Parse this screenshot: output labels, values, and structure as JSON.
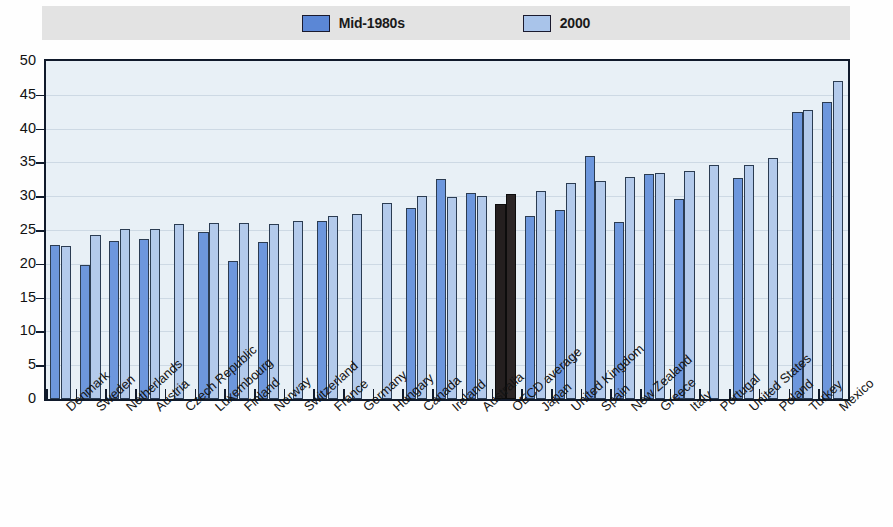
{
  "legend": {
    "items": [
      {
        "label": "Mid-1980s",
        "color": "#6d97dd",
        "key": "mid1980s"
      },
      {
        "label": "2000",
        "color": "#b3caeb",
        "key": "y2000"
      }
    ],
    "background": "#e3e3e3"
  },
  "axis": {
    "y_ticks": [
      "0",
      "5",
      "10",
      "15",
      "20",
      "25",
      "30",
      "35",
      "40",
      "45",
      "50"
    ]
  },
  "colors": {
    "series_mid1980s": "#6d97dd",
    "series_2000": "#b3caeb",
    "highlight_oecd": "#241f1f",
    "plot_background": "#e8f0f6",
    "frame": "#101a2b",
    "gridline": "#cdd9e4",
    "legend_background": "#e3e3e3"
  },
  "chart_data": {
    "type": "bar",
    "title": "",
    "subtitle": "",
    "xlabel": "",
    "ylabel": "",
    "ylim": [
      0,
      50
    ],
    "ytick_step": 5,
    "grid": true,
    "legend_position": "top",
    "highlight_category": "OECD average",
    "categories": [
      "Denmark",
      "Sweden",
      "Netherlands",
      "Austria",
      "Czech Republic",
      "Luxembourg",
      "Finland",
      "Norway",
      "Switzerland",
      "France",
      "Germany",
      "Hungary",
      "Canada",
      "Ireland",
      "Australia",
      "OECD average",
      "Japan",
      "United Kingdom",
      "Spain",
      "New Zealand",
      "Greece",
      "Italy",
      "Portugal",
      "United States",
      "Poland",
      "Turkey",
      "Mexico"
    ],
    "series": [
      {
        "name": "Mid-1980s",
        "color": "#6d97dd",
        "values": [
          22.8,
          19.8,
          23.4,
          23.6,
          null,
          24.7,
          20.4,
          23.2,
          null,
          26.4,
          null,
          null,
          28.2,
          32.5,
          30.5,
          28.9,
          27.1,
          28.0,
          36.0,
          26.2,
          33.3,
          29.6,
          null,
          32.7,
          null,
          42.5,
          44.0
        ]
      },
      {
        "name": "2000",
        "color": "#b3caeb",
        "values": [
          22.6,
          24.3,
          25.1,
          25.1,
          25.9,
          26.0,
          26.0,
          25.9,
          26.4,
          27.1,
          27.4,
          29.0,
          30.1,
          29.9,
          30.1,
          30.4,
          30.8,
          31.9,
          32.2,
          32.9,
          33.5,
          33.8,
          34.6,
          34.6,
          35.7,
          42.7,
          47.0
        ]
      }
    ]
  }
}
